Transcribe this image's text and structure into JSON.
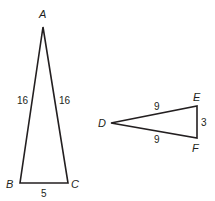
{
  "figure": {
    "triangle_abc": {
      "vertices": [
        {
          "label": "A",
          "x": 43,
          "y": 27
        },
        {
          "label": "B",
          "x": 20,
          "y": 183
        },
        {
          "label": "C",
          "x": 68,
          "y": 183
        }
      ],
      "sides": {
        "AB": "16",
        "AC": "16",
        "BC": "5"
      }
    },
    "triangle_def": {
      "vertices": [
        {
          "label": "D",
          "x": 111,
          "y": 123
        },
        {
          "label": "E",
          "x": 197,
          "y": 106
        },
        {
          "label": "F",
          "x": 197,
          "y": 138
        }
      ],
      "sides": {
        "DE": "9",
        "DF": "9",
        "EF": "3"
      }
    },
    "colors": {
      "stroke": "#231f20",
      "background": "#ffffff"
    }
  }
}
